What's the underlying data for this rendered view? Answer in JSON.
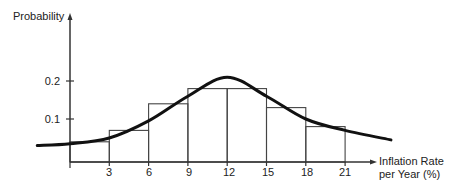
{
  "chart_data": {
    "type": "bar",
    "title": "",
    "subtitle": "",
    "xlabel": "Inflation Rate per Year (%)",
    "xlabel_lines": [
      "Inflation Rate",
      "per Year (%)"
    ],
    "ylabel": "Probability",
    "x_ticks": [
      "3",
      "6",
      "9",
      "12",
      "15",
      "18",
      "21"
    ],
    "y_ticks": [
      "0.1",
      "0.2"
    ],
    "xlim": [
      0,
      24
    ],
    "ylim": [
      0,
      0.25
    ],
    "grid": false,
    "legend": null,
    "categories": [
      "0-3",
      "3-6",
      "6-9",
      "9-12",
      "12-15",
      "15-18",
      "18-21"
    ],
    "bins": [
      [
        0,
        3
      ],
      [
        3,
        6
      ],
      [
        6,
        9
      ],
      [
        9,
        12
      ],
      [
        12,
        15
      ],
      [
        15,
        18
      ],
      [
        18,
        21
      ]
    ],
    "values": [
      0.04,
      0.07,
      0.14,
      0.18,
      0.18,
      0.13,
      0.08
    ],
    "overlay_curve": {
      "type": "line",
      "description": "smooth probability density curve overlaid on histogram",
      "x": [
        -2.5,
        0,
        3,
        6,
        9,
        12,
        15,
        18,
        21,
        24.5
      ],
      "y": [
        0.03,
        0.035,
        0.05,
        0.095,
        0.16,
        0.21,
        0.16,
        0.1,
        0.07,
        0.045
      ]
    }
  }
}
